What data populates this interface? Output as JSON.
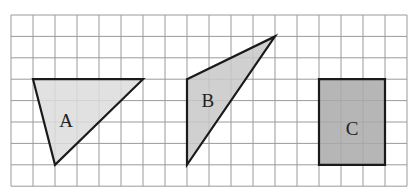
{
  "grid": {
    "columns": 18,
    "rows": 8,
    "origin_x": 11,
    "origin_y": 15,
    "cell_w": 22,
    "cell_h": 21.4,
    "line_color": "#9a9a9a"
  },
  "shapes": [
    {
      "id": "A",
      "label": "A",
      "type": "triangle",
      "vertices": [
        [
          1,
          3
        ],
        [
          6,
          3
        ],
        [
          2,
          7
        ]
      ],
      "fill": "#dcdcdc",
      "label_pos": [
        2.5,
        4.9
      ]
    },
    {
      "id": "B",
      "label": "B",
      "type": "triangle",
      "vertices": [
        [
          8,
          3
        ],
        [
          12,
          1
        ],
        [
          8,
          7
        ]
      ],
      "fill": "#c8c8c8",
      "label_pos": [
        8.95,
        3.95
      ]
    },
    {
      "id": "C",
      "label": "C",
      "type": "rectangle",
      "vertices": [
        [
          14,
          3
        ],
        [
          17,
          3
        ],
        [
          17,
          7
        ],
        [
          14,
          7
        ]
      ],
      "fill": "#a9a9a9",
      "label_pos": [
        15.5,
        5.3
      ]
    }
  ],
  "stroke_color": "#1a1a1a"
}
